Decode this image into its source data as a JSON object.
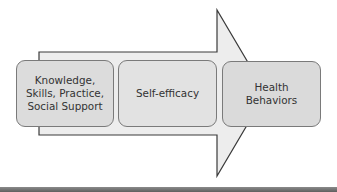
{
  "diagram": {
    "arrow": {
      "fill": "#ededed",
      "stroke": "#3a3a3a"
    },
    "boxes": [
      {
        "label": "Knowledge,\nSkills, Practice,\nSocial Support",
        "fill": "#dcdcdc"
      },
      {
        "label": "Self-efficacy",
        "fill": "#e2e2e2"
      },
      {
        "label": "Health\nBehaviors",
        "fill": "#dadada"
      }
    ]
  }
}
